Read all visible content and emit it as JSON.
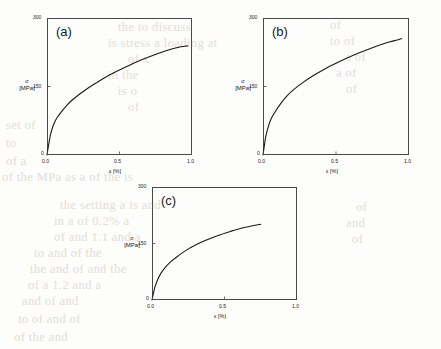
{
  "figure": {
    "background_color": "#fdfdfb",
    "axis_color": "#4a4a4a",
    "curve_color": "#1a1a1a"
  },
  "ghost_text": {
    "note": "faint show-through text from reverse side of scanned page",
    "lines": [
      {
        "text": "the to discuss",
        "x": 118,
        "y": 20
      },
      {
        "text": "is stress a loading at",
        "x": 108,
        "y": 36
      },
      {
        "text": "of x",
        "x": 128,
        "y": 52
      },
      {
        "text": "in the",
        "x": 108,
        "y": 68
      },
      {
        "text": "is o",
        "x": 118,
        "y": 84
      },
      {
        "text": "of",
        "x": 128,
        "y": 100
      },
      {
        "text": "set of",
        "x": 6,
        "y": 118
      },
      {
        "text": "to",
        "x": 6,
        "y": 136
      },
      {
        "text": "of a",
        "x": 6,
        "y": 154
      },
      {
        "text": "of the MPa as a of the is",
        "x": 2,
        "y": 170
      },
      {
        "text": "of",
        "x": 330,
        "y": 18
      },
      {
        "text": "to of",
        "x": 330,
        "y": 34
      },
      {
        "text": "s of",
        "x": 346,
        "y": 50
      },
      {
        "text": "a of",
        "x": 336,
        "y": 66
      },
      {
        "text": "of",
        "x": 346,
        "y": 82
      },
      {
        "text": "the setting a is and",
        "x": 60,
        "y": 198
      },
      {
        "text": "in a of 0.2% a",
        "x": 54,
        "y": 214
      },
      {
        "text": "of and 1.1 and a",
        "x": 54,
        "y": 230
      },
      {
        "text": "to and of the",
        "x": 34,
        "y": 246
      },
      {
        "text": "the and of and the",
        "x": 30,
        "y": 262
      },
      {
        "text": "of a 1.2 and a",
        "x": 28,
        "y": 278
      },
      {
        "text": "and of and",
        "x": 22,
        "y": 294
      },
      {
        "text": "to of and of",
        "x": 18,
        "y": 312
      },
      {
        "text": "of the and",
        "x": 14,
        "y": 330
      },
      {
        "text": "of",
        "x": 356,
        "y": 200
      },
      {
        "text": "and",
        "x": 346,
        "y": 216
      },
      {
        "text": "of",
        "x": 352,
        "y": 232
      }
    ]
  },
  "chart_data": [
    {
      "id": "panel-a",
      "type": "line",
      "title": "(a)",
      "xlabel": "ε [%]",
      "ylabel_symbol": "σ",
      "ylabel_unit": "[MPa]",
      "xlim": [
        0,
        1.0
      ],
      "ylim": [
        0,
        300
      ],
      "xticks": [
        0.0,
        0.5,
        1.0
      ],
      "xticklabels": [
        "0.0",
        "0.5",
        "1.0"
      ],
      "yticks": [
        0,
        150,
        300
      ],
      "yticklabels": [
        "0",
        "150",
        "300"
      ],
      "grid": false,
      "legend": "none",
      "series": [
        {
          "name": "stress-strain",
          "x": [
            0.0,
            0.01,
            0.02,
            0.03,
            0.05,
            0.07,
            0.1,
            0.14,
            0.18,
            0.24,
            0.3,
            0.38,
            0.46,
            0.55,
            0.64,
            0.72,
            0.8,
            0.86,
            0.91,
            0.95,
            0.97
          ],
          "y": [
            0,
            20,
            38,
            52,
            70,
            82,
            95,
            110,
            122,
            137,
            150,
            166,
            180,
            194,
            207,
            217,
            226,
            232,
            236,
            238,
            239
          ]
        }
      ]
    },
    {
      "id": "panel-b",
      "type": "line",
      "title": "(b)",
      "xlabel": "ε [%]",
      "ylabel_symbol": "σ",
      "ylabel_unit": "[MPa]",
      "xlim": [
        0,
        1.0
      ],
      "ylim": [
        0,
        300
      ],
      "xticks": [
        0.0,
        0.5,
        1.0
      ],
      "xticklabels": [
        "0.0",
        "0.5",
        "1.0"
      ],
      "yticks": [
        0,
        150,
        300
      ],
      "yticklabels": [
        "0",
        "150",
        "300"
      ],
      "grid": false,
      "legend": "none",
      "series": [
        {
          "name": "stress-strain",
          "x": [
            0.0,
            0.01,
            0.02,
            0.04,
            0.06,
            0.09,
            0.12,
            0.16,
            0.21,
            0.27,
            0.34,
            0.42,
            0.5,
            0.58,
            0.66,
            0.74,
            0.81,
            0.87,
            0.92,
            0.95
          ],
          "y": [
            0,
            22,
            42,
            66,
            82,
            98,
            112,
            128,
            143,
            158,
            173,
            188,
            201,
            213,
            224,
            234,
            242,
            248,
            252,
            255
          ]
        }
      ]
    },
    {
      "id": "panel-c",
      "type": "line",
      "title": "(c)",
      "xlabel": "ε [%]",
      "ylabel_symbol": "σ",
      "ylabel_unit": "[MPa]",
      "xlim": [
        0,
        1.0
      ],
      "ylim": [
        0,
        300
      ],
      "xticks": [
        0.0,
        0.5,
        1.0
      ],
      "xticklabels": [
        "0.0",
        "0.5",
        "1.0"
      ],
      "yticks": [
        0,
        150,
        300
      ],
      "yticklabels": [
        "0",
        "150",
        "300"
      ],
      "grid": false,
      "legend": "none",
      "series": [
        {
          "name": "stress-strain",
          "x": [
            0.0,
            0.01,
            0.02,
            0.04,
            0.06,
            0.09,
            0.13,
            0.18,
            0.24,
            0.31,
            0.38,
            0.46,
            0.54,
            0.61,
            0.67,
            0.72,
            0.75
          ],
          "y": [
            0,
            18,
            34,
            55,
            70,
            86,
            102,
            117,
            133,
            148,
            160,
            172,
            182,
            190,
            195,
            199,
            201
          ]
        }
      ]
    }
  ]
}
